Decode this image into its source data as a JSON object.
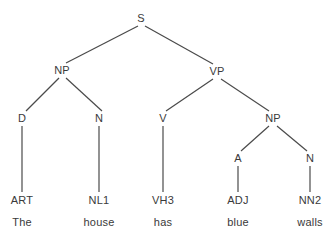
{
  "figure": {
    "type": "constituency-parse-tree",
    "sentence": "The house has blue walls",
    "background_color": "#ffffff",
    "line_color": "#4a4a4a",
    "text_color": "#3a3a3a"
  },
  "nodes": {
    "s": "S",
    "np_subject": "NP",
    "vp": "VP",
    "d": "D",
    "n_subject": "N",
    "v": "V",
    "np_object": "NP",
    "a": "A",
    "n_object": "N"
  },
  "pos_tags": {
    "art": "ART",
    "nl1": "NL1",
    "vh3": "VH3",
    "adj": "ADJ",
    "nn2": "NN2"
  },
  "words": {
    "the": "The",
    "house": "house",
    "has": "has",
    "blue": "blue",
    "walls": "walls"
  },
  "layout": {
    "levels": [
      {
        "name": "root",
        "y": 18
      },
      {
        "name": "phrase",
        "y": 70
      },
      {
        "name": "lexical",
        "y": 118
      },
      {
        "name": "inner",
        "y": 158
      },
      {
        "name": "pos",
        "y": 200
      },
      {
        "name": "word",
        "y": 222
      }
    ]
  }
}
